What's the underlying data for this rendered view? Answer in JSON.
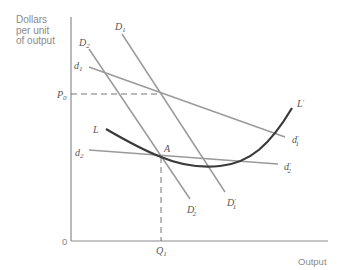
{
  "axes": {
    "y_label_lines": [
      "Dollars",
      "per unit",
      "of output"
    ],
    "x_label": "Output",
    "origin": "0",
    "y_tick": {
      "main": "P",
      "sub": "0"
    },
    "x_tick": {
      "main": "Q",
      "sub": "1"
    }
  },
  "curves": {
    "D1": {
      "main": "D",
      "sub": "1"
    },
    "D1p": {
      "main": "D",
      "sub": "1",
      "prime": "′"
    },
    "D2": {
      "main": "D",
      "sub": "2"
    },
    "D2p": {
      "main": "D",
      "sub": "2",
      "prime": "′"
    },
    "d1": {
      "main": "d",
      "sub": "1"
    },
    "d1p": {
      "main": "d",
      "sub": "1",
      "prime": "′"
    },
    "d2": {
      "main": "d",
      "sub": "2"
    },
    "d2p": {
      "main": "d",
      "sub": "2",
      "prime": "′"
    },
    "L": {
      "main": "L"
    },
    "Lp": {
      "main": "L",
      "prime": "′"
    }
  },
  "points": {
    "A": "A"
  },
  "colors": {
    "axis": "#8c8c8c",
    "demand_lines": "#9a9a9a",
    "lac_curve": "#3a3a3a",
    "dashed": "#777777"
  }
}
